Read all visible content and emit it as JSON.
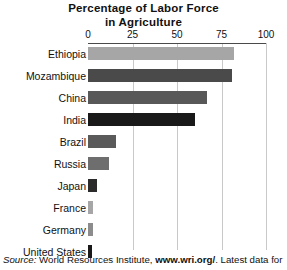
{
  "chart_data": {
    "type": "bar",
    "orientation": "horizontal",
    "title": "Percentage of Labor Force in Agriculture",
    "title_lines": [
      "Percentage of Labor Force",
      "in Agriculture"
    ],
    "xlabel": "",
    "ylabel": "",
    "xlim": [
      0,
      100
    ],
    "xticks": [
      0,
      25,
      50,
      75,
      100
    ],
    "xtick_labels": [
      "0",
      "25",
      "50",
      "75",
      "100"
    ],
    "grid": true,
    "grid_axis": "x",
    "axis_position": "top",
    "legend": "none",
    "categories": [
      "Ethiopia",
      "Mozambique",
      "China",
      "India",
      "Brazil",
      "Russia",
      "Japan",
      "France",
      "Germany",
      "United States"
    ],
    "values": [
      82,
      81,
      67,
      60,
      16,
      12,
      5,
      3,
      3,
      2.5
    ],
    "bar_colors": [
      "#a6a6a6",
      "#4a4a4a",
      "#585858",
      "#191919",
      "#5a5a5a",
      "#6e6e6e",
      "#2b2b2b",
      "#a6a6a6",
      "#8c8c8c",
      "#191919"
    ]
  },
  "source": {
    "prefix": "Source:",
    "institute": " World Resources Institute, ",
    "url": "www.wri.org/",
    "suffix": ". Latest data for"
  },
  "colors": {
    "gridline": "#c9c9c9",
    "axis": "#4a4a4a",
    "text": "#111111",
    "background": "#ffffff"
  }
}
